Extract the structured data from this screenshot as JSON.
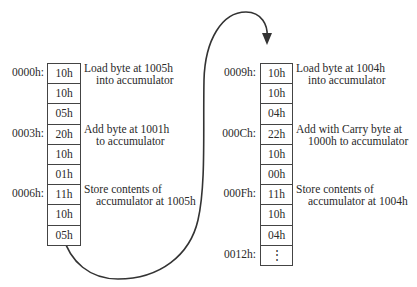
{
  "left_column": {
    "cells": [
      "10h",
      "10h",
      "05h",
      "20h",
      "10h",
      "01h",
      "11h",
      "10h",
      "05h"
    ],
    "addresses": [
      {
        "label": "0000h:",
        "row": 0
      },
      {
        "label": "0003h:",
        "row": 3
      },
      {
        "label": "0006h:",
        "row": 6
      }
    ],
    "notes": [
      {
        "row": 0,
        "line1": "Load byte at 1005h",
        "line2": "into accumulator"
      },
      {
        "row": 3,
        "line1": "Add byte at 1001h",
        "line2": "to accumulator"
      },
      {
        "row": 6,
        "line1": "Store contents of",
        "line2": "accumulator at 1005h"
      }
    ]
  },
  "right_column": {
    "cells": [
      "10h",
      "10h",
      "04h",
      "22h",
      "10h",
      "00h",
      "11h",
      "10h",
      "04h",
      "⋮"
    ],
    "addresses": [
      {
        "label": "0009h:",
        "row": 0
      },
      {
        "label": "000Ch:",
        "row": 3
      },
      {
        "label": "000Fh:",
        "row": 6
      },
      {
        "label": "0012h:",
        "row": 9
      }
    ],
    "notes": [
      {
        "row": 0,
        "line1": "Load byte at 1004h",
        "line2": "into accumulator"
      },
      {
        "row": 3,
        "line1": "Add with Carry byte at",
        "line2": "1000h to accumulator"
      },
      {
        "row": 6,
        "line1": "Store contents of",
        "line2": "accumulator at 1004h"
      }
    ]
  },
  "connector": {
    "from": "left-column-bottom",
    "to": "right-column-top",
    "icon": "curved-arrow"
  }
}
